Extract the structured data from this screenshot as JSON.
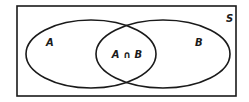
{
  "diagram": {
    "type": "venn",
    "universe_label": "S",
    "sets": [
      {
        "name": "A",
        "label": "A"
      },
      {
        "name": "B",
        "label": "B"
      }
    ],
    "intersection_label": "A ∩ B",
    "stroke_color": "#1a1a1a",
    "background_color": "#ffffff"
  }
}
